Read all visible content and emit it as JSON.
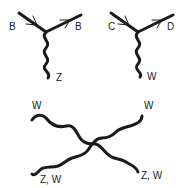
{
  "diagrams": {
    "vertex_z": {
      "incoming_label": "B",
      "outgoing_label": "B",
      "boson_label": "Z"
    },
    "vertex_w": {
      "incoming_label": "C",
      "outgoing_label": "D",
      "boson_label": "W"
    },
    "quartic": {
      "top_left_label": "W",
      "top_right_label": "W",
      "bottom_left_label": "Z, W",
      "bottom_right_label": "Z, W"
    }
  },
  "colors": {
    "line": "#1a1a1a",
    "background": "#ffffff"
  }
}
